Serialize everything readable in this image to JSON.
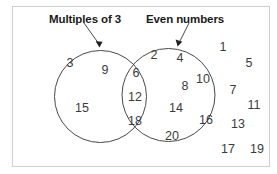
{
  "figure": {
    "type": "venn-diagram",
    "background_color": "#ffffff",
    "frame_border_color": "#cfcfcf",
    "circle_stroke_color": "#4a4a4a",
    "text_color": "#3b3b3b",
    "label_color": "#1a1a1a"
  },
  "labels": {
    "left": "Multiples of 3",
    "right": "Even numbers"
  },
  "chart_data": {
    "type": "venn",
    "title": "",
    "sets": [
      {
        "name": "Multiples of 3",
        "only": [
          3,
          9,
          15
        ]
      },
      {
        "name": "Even numbers",
        "only": [
          2,
          4,
          8,
          10,
          14,
          16,
          20
        ]
      }
    ],
    "intersection": [
      6,
      12,
      18
    ],
    "outside": [
      1,
      5,
      7,
      11,
      13,
      17,
      19
    ],
    "universe": [
      1,
      2,
      3,
      4,
      5,
      6,
      7,
      8,
      9,
      10,
      11,
      12,
      13,
      14,
      15,
      16,
      17,
      18,
      19,
      20
    ]
  },
  "regions": {
    "left_only": [
      {
        "value": "3",
        "x": 70,
        "y": 63
      },
      {
        "value": "9",
        "x": 105,
        "y": 70
      },
      {
        "value": "15",
        "x": 82,
        "y": 108
      }
    ],
    "intersection": [
      {
        "value": "6",
        "x": 136,
        "y": 73
      },
      {
        "value": "12",
        "x": 135,
        "y": 97
      },
      {
        "value": "18",
        "x": 135,
        "y": 121
      }
    ],
    "right_only": [
      {
        "value": "2",
        "x": 154,
        "y": 55
      },
      {
        "value": "4",
        "x": 180,
        "y": 58
      },
      {
        "value": "10",
        "x": 203,
        "y": 79
      },
      {
        "value": "8",
        "x": 185,
        "y": 86
      },
      {
        "value": "14",
        "x": 176,
        "y": 108
      },
      {
        "value": "16",
        "x": 206,
        "y": 120
      },
      {
        "value": "20",
        "x": 172,
        "y": 136
      }
    ],
    "outside": [
      {
        "value": "1",
        "x": 223,
        "y": 47
      },
      {
        "value": "5",
        "x": 249,
        "y": 63
      },
      {
        "value": "7",
        "x": 233,
        "y": 90
      },
      {
        "value": "11",
        "x": 254,
        "y": 105
      },
      {
        "value": "13",
        "x": 238,
        "y": 124
      },
      {
        "value": "17",
        "x": 228,
        "y": 149
      },
      {
        "value": "19",
        "x": 257,
        "y": 149
      }
    ]
  }
}
